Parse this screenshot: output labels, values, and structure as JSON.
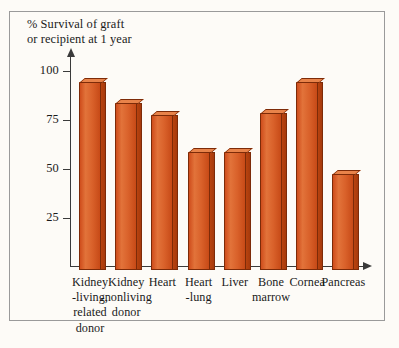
{
  "figure": {
    "title": "% Survival of graft\nor recipient at 1 year",
    "background_color": "#fdfbf7",
    "frame_color": "#9a9a9a",
    "bar_color": "#d9612a",
    "axis_color": "#3a3a3a"
  },
  "chart_data": {
    "type": "bar",
    "title": "% Survival of graft or recipient at 1 year",
    "xlabel": "",
    "ylabel": "% Survival of graft or recipient at 1 year",
    "ylim": [
      0,
      108
    ],
    "yticks": [
      25,
      50,
      75,
      100
    ],
    "ytick_labels": [
      "25",
      "50",
      "75",
      "100"
    ],
    "grid": false,
    "legend": false,
    "categories": [
      "Kidney -living, related donor",
      "Kidney -nonliving donor",
      "Heart",
      "Heart -lung",
      "Liver",
      "Bone marrow",
      "Cornea",
      "Pancreas"
    ],
    "category_labels": [
      "Kidney\n-living,\nrelated\ndonor",
      "Kidney\n-nonliving\ndonor",
      "Heart",
      "Heart\n-lung",
      "Liver",
      "Bone\nmarrow",
      "Cornea",
      "Pancreas"
    ],
    "values": [
      96,
      85,
      79,
      60,
      60,
      80,
      96,
      49
    ]
  }
}
